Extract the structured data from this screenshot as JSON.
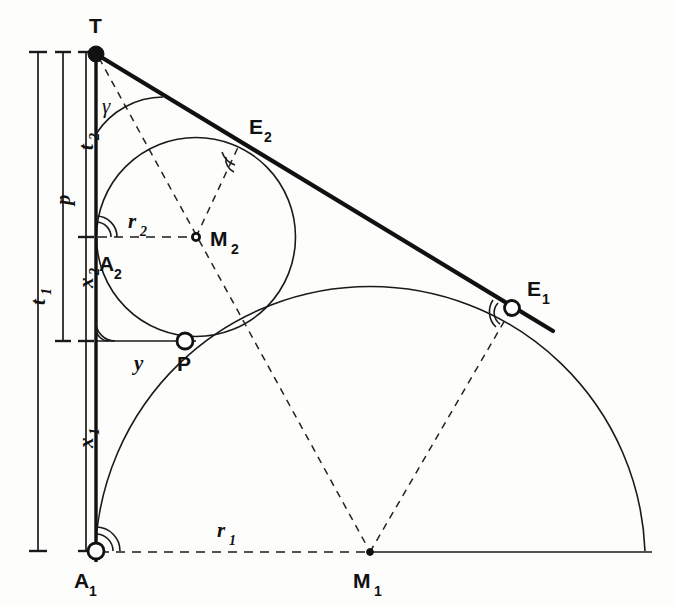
{
  "figure": {
    "kind": "geometry-construction-diagram",
    "background_color": "#fdfdfc",
    "ink_color": "#111111"
  },
  "points": [
    {
      "id": "T",
      "label": "T",
      "sub": "",
      "marker": "filled-dot",
      "x": 96,
      "y": 54,
      "label_x": 93,
      "label_y": 33
    },
    {
      "id": "E2",
      "label": "E",
      "sub": "2",
      "marker": "none",
      "x": 240,
      "y": 143,
      "label_x": 251,
      "label_y": 135
    },
    {
      "id": "E1",
      "label": "E",
      "sub": "1",
      "marker": "hollow-ring",
      "x": 512,
      "y": 308,
      "label_x": 528,
      "label_y": 296
    },
    {
      "id": "M2",
      "label": "M",
      "sub": "2",
      "marker": "small-ring",
      "x": 196,
      "y": 237,
      "label_x": 211,
      "label_y": 246
    },
    {
      "id": "A2",
      "label": "A",
      "sub": "2",
      "marker": "none",
      "x": 97,
      "y": 237,
      "label_x": 100,
      "label_y": 270
    },
    {
      "id": "P",
      "label": "P",
      "sub": "",
      "marker": "hollow-ring",
      "x": 185,
      "y": 341,
      "label_x": 179,
      "label_y": 370
    },
    {
      "id": "A1",
      "label": "A",
      "sub": "1",
      "marker": "hollow-ring",
      "x": 96,
      "y": 551,
      "label_x": 75,
      "label_y": 586
    },
    {
      "id": "M1",
      "label": "M",
      "sub": "1",
      "marker": "tiny-dot",
      "x": 370,
      "y": 552,
      "label_x": 356,
      "label_y": 586
    }
  ],
  "segment_labels": [
    {
      "id": "t1",
      "text": "t",
      "sub": "1",
      "x": 38,
      "y": 300,
      "rotate": -90,
      "style": "italic"
    },
    {
      "id": "p",
      "text": "p",
      "sub": "",
      "x": 63,
      "y": 200,
      "rotate": -90,
      "style": "italic"
    },
    {
      "id": "t2",
      "text": "t",
      "sub": "2",
      "x": 86,
      "y": 144,
      "rotate": -90,
      "style": "italic"
    },
    {
      "id": "x2",
      "text": "x",
      "sub": "2",
      "x": 86,
      "y": 281,
      "rotate": -90,
      "style": "italic"
    },
    {
      "id": "x1",
      "text": "x",
      "sub": "1",
      "x": 86,
      "y": 440,
      "rotate": -90,
      "style": "italic"
    },
    {
      "id": "r2",
      "text": "r",
      "sub": "2",
      "x": 133,
      "y": 222,
      "rotate": 0,
      "style": "italic"
    },
    {
      "id": "r1",
      "text": "r",
      "sub": "1",
      "x": 222,
      "y": 531,
      "rotate": 0,
      "style": "italic"
    },
    {
      "id": "y",
      "text": "y",
      "sub": "",
      "x": 140,
      "y": 363,
      "rotate": 0,
      "style": "italic"
    },
    {
      "id": "gamma",
      "text": "γ",
      "sub": "",
      "x": 107,
      "y": 106,
      "rotate": 0,
      "style": "greek"
    }
  ],
  "dimension_bars": [
    {
      "id": "t1-bar",
      "label": "t1",
      "x": 38,
      "y_top": 52,
      "y_bottom": 551,
      "tick_half_width": 9
    },
    {
      "id": "p-bar",
      "label": "p",
      "x": 63,
      "y_top": 52,
      "y_bottom": 341,
      "tick_half_width": 8
    },
    {
      "id": "t2-bar",
      "label": "t2",
      "x": 86,
      "y_top": 52,
      "y_bottom": 237,
      "tick_half_width": 8
    },
    {
      "id": "x2-bar",
      "label": "x2",
      "x": 86,
      "y_top": 237,
      "y_bottom": 341,
      "tick_half_width": 8
    },
    {
      "id": "x1-bar",
      "label": "x1",
      "x": 86,
      "y_top": 341,
      "y_bottom": 551,
      "tick_half_width": 8
    }
  ],
  "geometry": {
    "vertical_axis": {
      "x": 96,
      "y_top": 54,
      "y_bottom": 560
    },
    "tangent_line": {
      "x1": 96,
      "y1": 54,
      "x2": 556,
      "y2": 332
    },
    "big_arc": {
      "cx": 370,
      "cy": 552,
      "r": 275,
      "from_deg": 180,
      "to_deg": 0,
      "tangent_point": "A1",
      "touch_point": "E1"
    },
    "small_circle": {
      "cx": 196,
      "cy": 237,
      "r": 100,
      "tangent_point": "A2",
      "touch_points": [
        "E2",
        "P"
      ]
    },
    "baseline": {
      "x1": 96,
      "y1": 552,
      "x2": 656,
      "y2": 552,
      "dashed_until_x": 370
    },
    "r2_line": {
      "x1": 97,
      "y1": 237,
      "x2": 196,
      "y2": 237
    },
    "y_line": {
      "x1": 96,
      "y1": 341,
      "x2": 196,
      "y2": 341
    },
    "dashes": [
      {
        "id": "T-to-M1",
        "x1": 96,
        "y1": 54,
        "x2": 370,
        "y2": 552
      },
      {
        "id": "M2-to-E2",
        "x1": 196,
        "y1": 237,
        "x2": 240,
        "y2": 143
      },
      {
        "id": "M1-to-E1",
        "x1": 370,
        "y1": 552,
        "x2": 512,
        "y2": 308
      }
    ]
  },
  "angle_marks": [
    {
      "id": "gamma-at-T",
      "at": "T",
      "note": "angle gamma between vertical axis and tangent line",
      "arcs": 1
    },
    {
      "id": "right-at-E2",
      "at": "E2",
      "note": "right angle between tangent and radius M2E2",
      "arcs": 2
    },
    {
      "id": "right-at-E1",
      "at": "E1",
      "note": "right angle between tangent and radius M1E1",
      "arcs": 2
    },
    {
      "id": "right-at-A2",
      "at": "A2",
      "note": "right angle between vertical axis and radius r2",
      "arcs": 2
    },
    {
      "id": "right-at-P",
      "at": "P",
      "note": "right angle between vertical axis and segment y",
      "arcs": 2
    },
    {
      "id": "right-at-A1",
      "at": "A1",
      "note": "right angle between vertical axis and radius r1",
      "arcs": 2
    }
  ]
}
